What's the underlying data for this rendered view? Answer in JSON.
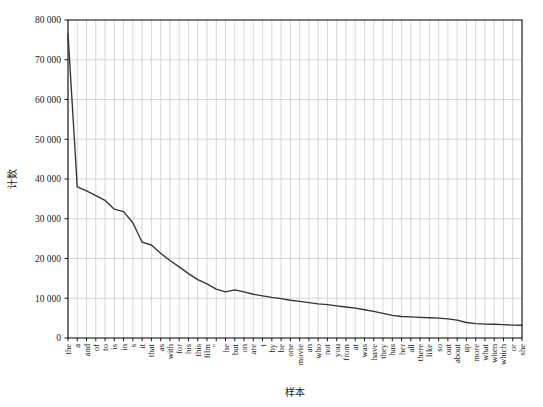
{
  "chart_data": {
    "type": "line",
    "title": "",
    "xlabel": "样本",
    "ylabel": "计数",
    "ylim": [
      0,
      80000
    ],
    "yticks": [
      0,
      10000,
      20000,
      30000,
      40000,
      50000,
      60000,
      70000,
      80000
    ],
    "ytick_labels": [
      "0",
      "10 000",
      "20 000",
      "30 000",
      "40 000",
      "50 000",
      "60 000",
      "70 000",
      "80 000"
    ],
    "grid": true,
    "grid_x": true,
    "grid_y": true,
    "legend": "none",
    "line_color": "#333333",
    "grid_color": "#b9bcc4",
    "axis_color": "#000000",
    "background": "#ffffff",
    "categories": [
      "the",
      "a",
      "and",
      "of",
      "to",
      "is",
      "in",
      "s",
      "it",
      "that",
      "as",
      "with",
      "for",
      "his",
      "this",
      "film",
      "\"",
      "he",
      "but",
      "on",
      "are",
      "t",
      "by",
      "be",
      "one",
      "movie",
      "an",
      "who",
      "not",
      "you",
      "from",
      "at",
      "was",
      "have",
      "they",
      "has",
      "her",
      "all",
      "there",
      "like",
      "so",
      "out",
      "about",
      "up",
      "more",
      "what",
      "when",
      "which",
      "or",
      "she"
    ],
    "values": [
      76500,
      38000,
      37000,
      35800,
      34600,
      32400,
      31800,
      29000,
      24100,
      23400,
      21300,
      19500,
      17900,
      16200,
      14700,
      13600,
      12300,
      11600,
      12100,
      11600,
      11000,
      10600,
      10200,
      9900,
      9500,
      9200,
      8900,
      8600,
      8400,
      8100,
      7800,
      7500,
      7100,
      6700,
      6200,
      5700,
      5400,
      5300,
      5200,
      5100,
      5000,
      4800,
      4500,
      3900,
      3600,
      3500,
      3450,
      3350,
      3250,
      3200
    ]
  },
  "figure": {
    "plot_left": 68,
    "plot_right": 522,
    "plot_top": 20,
    "plot_bottom": 338
  }
}
